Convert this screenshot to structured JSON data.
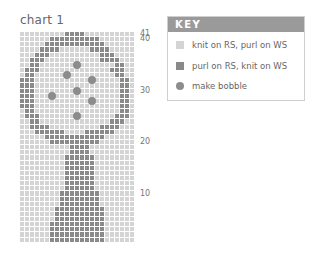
{
  "chart": {
    "title": "chart 1",
    "columns": 23,
    "rows": 41,
    "row_labels": [
      {
        "label": "41",
        "row": 41
      },
      {
        "label": "40",
        "row": 40
      },
      {
        "label": "30",
        "row": 30
      },
      {
        "label": "20",
        "row": 20
      },
      {
        "label": "10",
        "row": 10
      }
    ],
    "pattern_top_to_bottom": [
      ".........####..........",
      "......##########.......",
      ".....############......",
      "....####......####.....",
      "...###..........###....",
      "..###...........####...",
      "..##.......o.......##..",
      ".###..............###..",
      ".##......o.........##..",
      "###...........o.....##.",
      "###.................##.",
      "###........o........##.",
      "###...o.............##.",
      "###...........o.....##.",
      "###.................##.",
      ".##.................##.",
      ".###.......o.......###.",
      "..##..............###..",
      "..####..........####...",
      "...######....######....",
      ".....############......",
      "......##########.......",
      "..........####.........",
      "..........####.........",
      ".........######........",
      ".........######........",
      ".........######........",
      ".........######........",
      ".........######........",
      ".........######........",
      ".........######........",
      "........########.......",
      "........########.......",
      "........########.......",
      ".......##########......",
      ".......##########......",
      ".......##########......",
      "......###########......",
      "......###########......",
      "......###########......",
      "......###########......"
    ]
  },
  "key": {
    "header": "KEY",
    "items": [
      {
        "swatch": "light",
        "label": "knit on RS, purl on WS"
      },
      {
        "swatch": "dark",
        "label": "purl on RS, knit on WS"
      },
      {
        "swatch": "bobble",
        "label": "make bobble"
      }
    ]
  },
  "colors": {
    "light_cell": "#d4d4d4",
    "dark_cell": "#8a8a8a",
    "key_header": "#9a9a9a"
  }
}
